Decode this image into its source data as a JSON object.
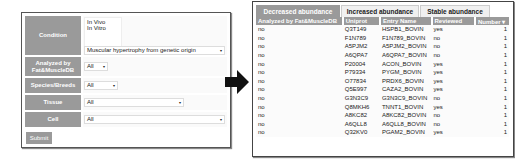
{
  "form": {
    "condition": {
      "label": "Condition",
      "options": [
        "In Vivo",
        "In Vitro"
      ],
      "select_value": "Muscular hypertrophy from genetic origin"
    },
    "analyzed": {
      "label": "Analyzed by Fat&MuscleDB",
      "value": "All"
    },
    "species": {
      "label": "Species/Breeds",
      "value": "All"
    },
    "tissue": {
      "label": "Tissue",
      "value": "All"
    },
    "cell": {
      "label": "Cell",
      "value": "All"
    },
    "submit_label": "Submit",
    "dropdown_arrow": "▾"
  },
  "results": {
    "tabs": [
      {
        "label": "Decreased abundance",
        "active": true
      },
      {
        "label": "Increased abundance",
        "active": false
      },
      {
        "label": "Stable abundance",
        "active": false
      }
    ],
    "columns": [
      "Analyzed by Fat&MuscleDB",
      "Uniprot",
      "Entry Name",
      "Reviewed",
      "Number ▾"
    ],
    "rows": [
      [
        "no",
        "Q3T149",
        "HSPB1_BOVIN",
        "yes",
        "1"
      ],
      [
        "no",
        "F1N789",
        "F1N789_BOVIN",
        "no",
        "1"
      ],
      [
        "no",
        "A5PJM2",
        "A5PJM2_BOVIN",
        "no",
        "1"
      ],
      [
        "no",
        "A6QPA7",
        "A6QPA7_BOVIN",
        "no",
        "1"
      ],
      [
        "no",
        "P20004",
        "ACON_BOVIN",
        "yes",
        "1"
      ],
      [
        "no",
        "P79334",
        "PYGM_BOVIN",
        "yes",
        "1"
      ],
      [
        "no",
        "O77834",
        "PRDX6_BOVIN",
        "yes",
        "1"
      ],
      [
        "no",
        "Q5E997",
        "CAZA2_BOVIN",
        "yes",
        "1"
      ],
      [
        "no",
        "G3N3C9",
        "G3N3C9_BOVIN",
        "no",
        "1"
      ],
      [
        "no",
        "Q8MKH6",
        "TNNT1_BOVIN",
        "yes",
        "1"
      ],
      [
        "no",
        "A8KC82",
        "A8KC82_BOVIN",
        "no",
        "1"
      ],
      [
        "no",
        "A6QLL8",
        "A6QLL8_BOVIN",
        "no",
        "1"
      ],
      [
        "no",
        "Q32KV0",
        "PGAM2_BOVIN",
        "yes",
        "1"
      ]
    ]
  }
}
